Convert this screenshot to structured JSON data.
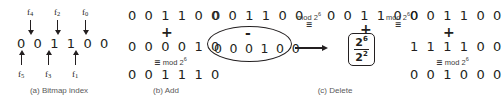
{
  "figure": {
    "background_color": "#ffffff",
    "ink_color": "#231f20",
    "caption_color": "#5a5a5a"
  },
  "panel_a": {
    "caption": "(a) Bitmap index",
    "bits": "0 0 1 1 0 0",
    "top_labels": [
      "f4",
      "f2",
      "f0"
    ],
    "top_labels_display": [
      {
        "base": "f",
        "sub": "4"
      },
      {
        "base": "f",
        "sub": "2"
      },
      {
        "base": "f",
        "sub": "0"
      }
    ],
    "bottom_labels_display": [
      {
        "base": "f",
        "sub": "5"
      },
      {
        "base": "f",
        "sub": "3"
      },
      {
        "base": "f",
        "sub": "1"
      }
    ],
    "top_arrow_direction": "down",
    "bottom_arrow_direction": "up"
  },
  "panel_b": {
    "caption": "(b) Add",
    "operand1": "0 0 1 1 0 0",
    "operator": "+",
    "operand2": "0 0 0 0 1 0",
    "mod_symbol": "≡",
    "mod_text": "mod 2",
    "mod_exponent": "6",
    "result": "0 0 1 1 1 0"
  },
  "panel_c": {
    "caption": "(c) Delete",
    "left": {
      "operand1": "0 0 1 1 0 0",
      "operator": "-",
      "operand2": "0 0 0 1 0 0",
      "circled": true
    },
    "mod_symbol": "≡",
    "mod_text": "mod 2",
    "mod_exponent": "6",
    "middle": {
      "operand1": "0 0 1 1 0 0",
      "operator": "+",
      "fraction_numerator": "2",
      "fraction_numerator_exp": "6",
      "fraction_denominator": "2",
      "fraction_denominator_exp": "2",
      "boxed": true
    },
    "arrow": "→",
    "mod_symbol2": "≡",
    "mod_text2": "mod 2",
    "mod_exponent2": "6",
    "right": {
      "operand1": "0 0 1 1 0 0",
      "operator": "+",
      "operand2": "1 1 1 1 0 0",
      "mod_symbol": "≡",
      "mod_text": "mod 2",
      "mod_exponent": "6",
      "result": "0 0 1 0 0 0"
    }
  }
}
